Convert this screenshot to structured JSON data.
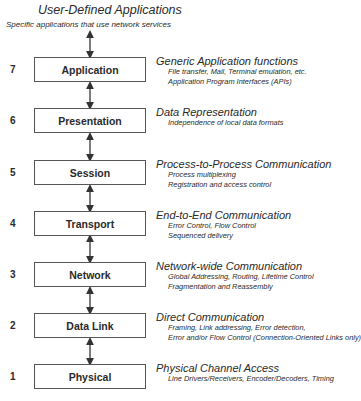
{
  "top": {
    "title": "User-Defined Applications",
    "subtitle": "Specific applications that use network services"
  },
  "layers": [
    {
      "number": "7",
      "name": "Application",
      "heading": "Generic Application functions",
      "lines": [
        "File transfer, Mail, Terminal emulation, etc.",
        "Application Program Interfaces (APIs)"
      ]
    },
    {
      "number": "6",
      "name": "Presentation",
      "heading": "Data Representation",
      "lines": [
        "Independence of local data formats"
      ]
    },
    {
      "number": "5",
      "name": "Session",
      "heading": "Process-to-Process Communication",
      "lines": [
        "Process multiplexing",
        "Registration and access control"
      ]
    },
    {
      "number": "4",
      "name": "Transport",
      "heading": "End-to-End Communication",
      "lines": [
        "Error Control, Flow Control",
        "Sequenced delivery"
      ]
    },
    {
      "number": "3",
      "name": "Network",
      "heading": "Network-wide Communication",
      "lines": [
        "Global Addressing, Routing, Lifetime Control",
        "Fragmentation and Reassembly"
      ]
    },
    {
      "number": "2",
      "name": "Data Link",
      "heading": "Direct Communication",
      "lines": [
        "Framing, Link addressing, Error detection,",
        "Error and/or Flow Control (Connection-Oriented Links only)"
      ]
    },
    {
      "number": "1",
      "name": "Physical",
      "heading": "Physical Channel Access",
      "lines": [
        "Line Drivers/Receivers, Encoder/Decoders, Timing"
      ]
    }
  ]
}
